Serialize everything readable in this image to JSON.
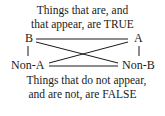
{
  "diagram": {
    "type": "square-of-opposition",
    "top_caption": {
      "line1": "Things that are, and",
      "line2": "that appear, are TRUE"
    },
    "bottom_caption": {
      "line1": "Things that do not appear,",
      "line2": "and are not, are FALSE"
    },
    "nodes": {
      "top_left": "B",
      "top_right": "A",
      "bottom_left": "Non-A",
      "bottom_right": "Non-B"
    },
    "edges": [
      {
        "from": "B",
        "to": "A"
      },
      {
        "from": "B",
        "to": "Non-A"
      },
      {
        "from": "A",
        "to": "Non-B"
      },
      {
        "from": "Non-A",
        "to": "Non-B"
      },
      {
        "from": "B",
        "to": "Non-B"
      },
      {
        "from": "A",
        "to": "Non-A"
      }
    ],
    "colors": {
      "ink": "#1a1a1a",
      "background": "#ffffff"
    }
  }
}
